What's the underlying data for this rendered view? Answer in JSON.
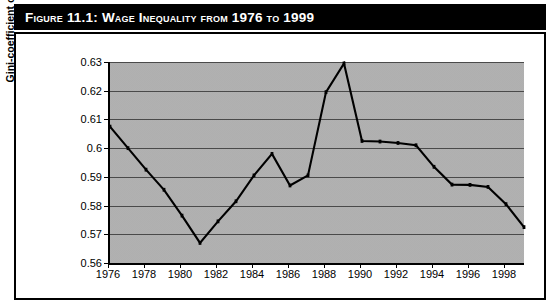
{
  "figure": {
    "title": "Figure 11.1: Wage Inequality from 1976 to 1999"
  },
  "chart_data": {
    "type": "line",
    "title": "Wage Inequality from 1976 to 1999",
    "xlabel": "",
    "ylabel": "Gini-coefficient of labor market income",
    "xlim": [
      1976,
      1999
    ],
    "ylim": [
      0.56,
      0.63
    ],
    "grid": true,
    "legend": false,
    "line_color": "#000000",
    "plot_background": "#b3b3b3",
    "y_ticks": [
      "0.63",
      "0.62",
      "0.61",
      "0.6",
      "0.59",
      "0.58",
      "0.57",
      "0.56"
    ],
    "y_tick_values": [
      0.63,
      0.62,
      0.61,
      0.6,
      0.59,
      0.58,
      0.57,
      0.56
    ],
    "x_ticks": [
      "1976",
      "1978",
      "1980",
      "1982",
      "1984",
      "1986",
      "1988",
      "1990",
      "1992",
      "1994",
      "1996",
      "1998"
    ],
    "x_tick_values": [
      1976,
      1978,
      1980,
      1982,
      1984,
      1986,
      1988,
      1990,
      1992,
      1994,
      1996,
      1998
    ],
    "x": [
      1976,
      1977,
      1978,
      1979,
      1980,
      1981,
      1982,
      1983,
      1984,
      1985,
      1986,
      1987,
      1988,
      1989,
      1990,
      1991,
      1992,
      1993,
      1994,
      1995,
      1996,
      1997,
      1998,
      1999
    ],
    "values": [
      0.6075,
      0.6,
      0.5925,
      0.5855,
      0.5765,
      0.567,
      0.5745,
      0.5815,
      0.5905,
      0.598,
      0.587,
      0.5905,
      0.6195,
      0.6295,
      0.6025,
      0.6023,
      0.6018,
      0.601,
      0.5935,
      0.5873,
      0.5872,
      0.5865,
      0.5805,
      0.5725
    ]
  }
}
